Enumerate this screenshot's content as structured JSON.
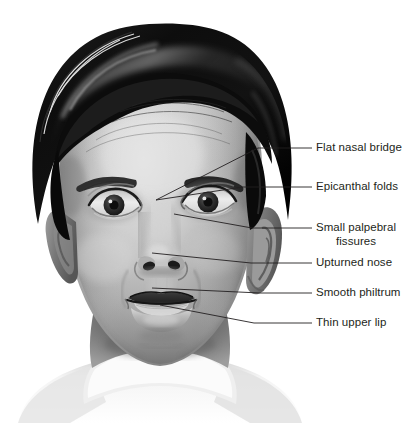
{
  "figure": {
    "width": 407,
    "height": 423,
    "background_color": "#ffffff",
    "text_color": "#231f20",
    "leader_line_color": "#231f20"
  },
  "annotations": [
    {
      "id": "flat-nasal-bridge",
      "label": "Flat nasal bridge",
      "label_x": 316,
      "label_y": 141,
      "align": "left",
      "leader": {
        "rule_x1": 293,
        "rule_y1": 148,
        "rule_x2": 312,
        "rule_y2": 148,
        "path": [
          [
            293,
            148
          ],
          [
            258,
            148
          ],
          [
            156,
            200
          ]
        ]
      }
    },
    {
      "id": "epicanthal-folds",
      "label": "Epicanthal folds",
      "label_x": 316,
      "label_y": 180,
      "align": "left",
      "leader": {
        "rule_x1": 293,
        "rule_y1": 187,
        "rule_x2": 312,
        "rule_y2": 187,
        "path": [
          [
            293,
            187
          ],
          [
            243,
            187
          ],
          [
            156,
            200
          ]
        ]
      }
    },
    {
      "id": "small-palpebral-fissures",
      "label": "Small palpebral\nfissures",
      "label_x": 316,
      "label_y": 221,
      "align": "left",
      "leader": {
        "rule_x1": 293,
        "rule_y1": 228,
        "rule_x2": 312,
        "rule_y2": 228,
        "path": [
          [
            293,
            228
          ],
          [
            252,
            228
          ],
          [
            174,
            214
          ]
        ]
      }
    },
    {
      "id": "upturned-nose",
      "label": "Upturned nose",
      "label_x": 316,
      "label_y": 256,
      "align": "left",
      "leader": {
        "rule_x1": 293,
        "rule_y1": 263,
        "rule_x2": 312,
        "rule_y2": 263,
        "path": [
          [
            293,
            263
          ],
          [
            251,
            263
          ],
          [
            152,
            253
          ]
        ]
      }
    },
    {
      "id": "smooth-philtrum",
      "label": "Smooth philtrum",
      "label_x": 316,
      "label_y": 286,
      "align": "left",
      "leader": {
        "rule_x1": 293,
        "rule_y1": 293,
        "rule_x2": 312,
        "rule_y2": 293,
        "path": [
          [
            293,
            293
          ],
          [
            260,
            293
          ],
          [
            152,
            288
          ]
        ]
      }
    },
    {
      "id": "thin-upper-lip",
      "label": "Thin upper lip",
      "label_x": 316,
      "label_y": 316,
      "align": "left",
      "leader": {
        "rule_x1": 293,
        "rule_y1": 323,
        "rule_x2": 312,
        "rule_y2": 323,
        "path": [
          [
            293,
            323
          ],
          [
            254,
            323
          ],
          [
            160,
            305
          ]
        ]
      }
    }
  ],
  "palette": {
    "hair_dark": "#0a0a0a",
    "hair_mid": "#2b2b2b",
    "hair_highlight": "#6e6e6e",
    "skin_light": "#dedede",
    "skin_mid": "#b4b4b4",
    "skin_shadow": "#8a8a8a",
    "skin_deep_shadow": "#5e5e5e",
    "eye_dark": "#1c1c1c",
    "iris": "#3a3a3a",
    "sclera": "#e8e8e8",
    "lip_dark": "#4a4a4a",
    "lip_mid": "#9a9a9a",
    "teeth": "#dcdcdc",
    "shirt_light": "#f2f2f2",
    "shirt_shadow": "#9e9e9e",
    "neck_shadow": "#6a6a6a"
  }
}
